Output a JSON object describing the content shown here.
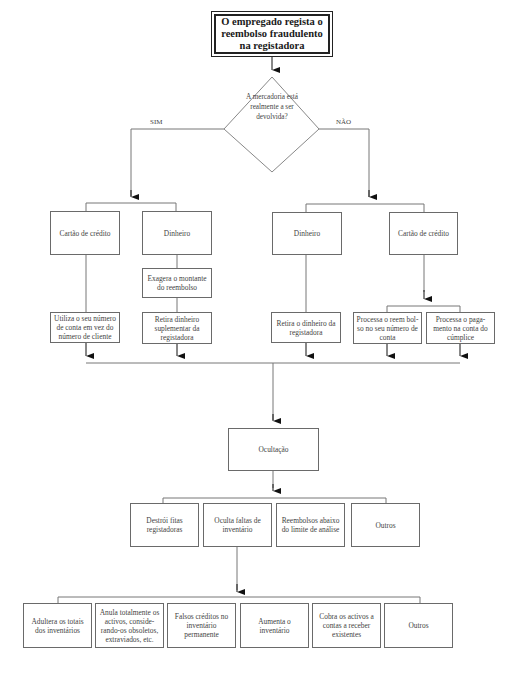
{
  "title": "O empregado regista o reembolso fraudulento na registadora",
  "decision": {
    "question": "A mercadoria está realmente a ser devolvida?",
    "yes_label": "SIM",
    "no_label": "NÃO"
  },
  "yes_branch": {
    "credit_card": {
      "label": "Cartão de crédito",
      "action": "Utiliza o seu número de conta em vez do número de cliente"
    },
    "cash": {
      "label": "Dinheiro",
      "step1": "Exagera o montante do reembolso",
      "step2": "Retira dinheiro suplementar da registadora"
    }
  },
  "no_branch": {
    "cash": {
      "label": "Dinheiro",
      "action": "Retira o dinheiro da registadora"
    },
    "credit_card": {
      "label": "Cartão de crédito",
      "actions": [
        "Processa o reem bol-so no seu número de conta",
        "Processa o paga-mento na conta do cúmplice"
      ]
    }
  },
  "concealment": {
    "label": "Ocultação",
    "methods": [
      "Destrói fitas registadoras",
      "Oculta faltas de inventário",
      "Reembolsos abaixo do limite de análise",
      "Outros"
    ]
  },
  "inventory_concealment": {
    "methods": [
      "Adultera os totais dos inventários",
      "Anula totalmente os activos, conside-rando-os obsoletos, extraviados, etc.",
      "Falsos créditos no inventário permanente",
      "Aumenta o inventário",
      "Cobra os activos a contas a receber existentes",
      "Outros"
    ]
  }
}
